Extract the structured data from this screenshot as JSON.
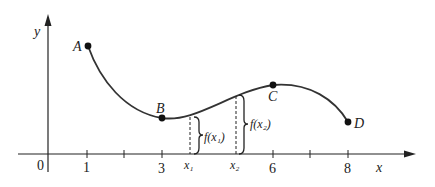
{
  "figure": {
    "axes": {
      "x_label": "x",
      "y_label": "y",
      "origin_label": "0",
      "x_ticks": [
        {
          "label": "1",
          "value": 1
        },
        {
          "label": "",
          "value": 2
        },
        {
          "label": "3",
          "value": 3
        },
        {
          "label": "x₁",
          "value": 3.75,
          "italic": true
        },
        {
          "label": "x₂",
          "value": 5.0,
          "italic": true
        },
        {
          "label": "6",
          "value": 6
        },
        {
          "label": "",
          "value": 7
        },
        {
          "label": "8",
          "value": 8
        }
      ]
    },
    "points": [
      {
        "name": "A",
        "x": 1,
        "label": "A"
      },
      {
        "name": "B",
        "x": 3,
        "label": "B"
      },
      {
        "name": "C",
        "x": 6,
        "label": "C"
      },
      {
        "name": "D",
        "x": 8,
        "label": "D"
      }
    ],
    "annotations": {
      "f_x1": "f(x₁)",
      "f_x2": "f(x₂)"
    },
    "colors": {
      "curve": "#333333",
      "axes": "#222222",
      "background": "#ffffff"
    }
  }
}
